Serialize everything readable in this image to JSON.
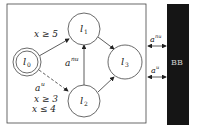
{
  "diagram": {
    "states": [
      {
        "id": "l0",
        "label": "l",
        "sub": "0",
        "initial": true
      },
      {
        "id": "l1",
        "label": "l",
        "sub": "1"
      },
      {
        "id": "l2",
        "label": "l",
        "sub": "2"
      },
      {
        "id": "l3",
        "label": "l",
        "sub": "3"
      }
    ],
    "edges": [
      {
        "from": "l0",
        "to": "l1",
        "guard": "x ≥ 5",
        "style": "solid"
      },
      {
        "from": "l0",
        "to": "l2",
        "label": "a",
        "sup": "u",
        "guard1": "x ≥ 3",
        "guard2": "x ≤ 4",
        "style": "dashed"
      },
      {
        "from": "l2",
        "to": "l1",
        "label": "a",
        "sup": "nu",
        "style": "solid"
      },
      {
        "from": "l1",
        "to": "l3",
        "style": "solid"
      },
      {
        "from": "l2",
        "to": "l3",
        "style": "solid"
      }
    ],
    "interface": [
      {
        "label": "a",
        "sup": "nu"
      },
      {
        "label": "a",
        "sup": "u"
      }
    ],
    "blackbox": {
      "label": "BB",
      "color": "#151515"
    }
  }
}
